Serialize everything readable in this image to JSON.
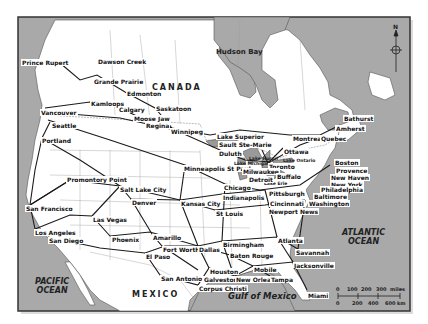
{
  "colors": {
    "ocean": "#a9a9a9",
    "land": "#ffffff",
    "frame": "#333333",
    "route": "#1a1a1a",
    "border": "#888888"
  },
  "map": {
    "regions": {
      "canada": "CANADA",
      "mexico": "MEXICO"
    },
    "water": {
      "hudson_bay": "Hudson Bay",
      "pacific": "PACIFIC\nOCEAN",
      "atlantic": "ATLANTIC\nOCEAN",
      "gulf": "Gulf of Mexico",
      "lake_superior": "Lake Superior",
      "lake_huron": "Lake Huron",
      "lake_michigan": "Lake Michigan",
      "lake_ontario": "Lake Ontario",
      "lake_erie": "Lake Erie"
    },
    "cities": [
      {
        "name": "Prince Rupert",
        "x": 21,
        "y": 59
      },
      {
        "name": "Dawson Creek",
        "x": 97,
        "y": 58
      },
      {
        "name": "Grande Prairie",
        "x": 93,
        "y": 78
      },
      {
        "name": "Edmonton",
        "x": 126,
        "y": 90
      },
      {
        "name": "Kamloops",
        "x": 90,
        "y": 100
      },
      {
        "name": "Calgary",
        "x": 118,
        "y": 106
      },
      {
        "name": "Saskatoon",
        "x": 155,
        "y": 105
      },
      {
        "name": "Moose Jaw",
        "x": 133,
        "y": 115
      },
      {
        "name": "Regina",
        "x": 145,
        "y": 122
      },
      {
        "name": "Winnipeg",
        "x": 170,
        "y": 128
      },
      {
        "name": "Vancouver",
        "x": 40,
        "y": 109
      },
      {
        "name": "Seattle",
        "x": 51,
        "y": 122
      },
      {
        "name": "Portland",
        "x": 41,
        "y": 137
      },
      {
        "name": "Lake Superior",
        "x": 216,
        "y": 133
      },
      {
        "name": "Sault Ste-Marie",
        "x": 218,
        "y": 141
      },
      {
        "name": "Duluth",
        "x": 218,
        "y": 150
      },
      {
        "name": "Montreal",
        "x": 292,
        "y": 135
      },
      {
        "name": "Quebec",
        "x": 320,
        "y": 135
      },
      {
        "name": "Ottawa",
        "x": 283,
        "y": 148
      },
      {
        "name": "Bathurst",
        "x": 343,
        "y": 115
      },
      {
        "name": "Amherst",
        "x": 335,
        "y": 125
      },
      {
        "name": "Minneapolis St Paul",
        "x": 183,
        "y": 165
      },
      {
        "name": "Toronto",
        "x": 268,
        "y": 163
      },
      {
        "name": "Milwaukee",
        "x": 242,
        "y": 168
      },
      {
        "name": "Detroit",
        "x": 248,
        "y": 176
      },
      {
        "name": "Buffalo",
        "x": 276,
        "y": 173
      },
      {
        "name": "Boston",
        "x": 334,
        "y": 159
      },
      {
        "name": "Provence",
        "x": 335,
        "y": 167
      },
      {
        "name": "New Haven",
        "x": 330,
        "y": 174
      },
      {
        "name": "New York",
        "x": 330,
        "y": 181
      },
      {
        "name": "Chicago",
        "x": 223,
        "y": 184
      },
      {
        "name": "Philadelphia",
        "x": 320,
        "y": 186
      },
      {
        "name": "Baltimore",
        "x": 313,
        "y": 193
      },
      {
        "name": "Washington",
        "x": 308,
        "y": 200
      },
      {
        "name": "Promontory Point",
        "x": 66,
        "y": 176
      },
      {
        "name": "Salt Lake City",
        "x": 119,
        "y": 186
      },
      {
        "name": "Indianapolis",
        "x": 222,
        "y": 194
      },
      {
        "name": "Pittsburgh",
        "x": 268,
        "y": 190
      },
      {
        "name": "Kansas City",
        "x": 180,
        "y": 200
      },
      {
        "name": "Cincinnati",
        "x": 269,
        "y": 200
      },
      {
        "name": "Denver",
        "x": 131,
        "y": 199
      },
      {
        "name": "Newport News",
        "x": 268,
        "y": 208
      },
      {
        "name": "St Louis",
        "x": 215,
        "y": 210
      },
      {
        "name": "San Francisco",
        "x": 25,
        "y": 205
      },
      {
        "name": "Las Vegas",
        "x": 92,
        "y": 216
      },
      {
        "name": "Los Angeles",
        "x": 34,
        "y": 229
      },
      {
        "name": "San Diego",
        "x": 48,
        "y": 237
      },
      {
        "name": "Phoenix",
        "x": 111,
        "y": 236
      },
      {
        "name": "Amarillo",
        "x": 152,
        "y": 234
      },
      {
        "name": "Birmingham",
        "x": 222,
        "y": 241
      },
      {
        "name": "Atlanta",
        "x": 277,
        "y": 237
      },
      {
        "name": "Fort Worth",
        "x": 162,
        "y": 246
      },
      {
        "name": "Dallas",
        "x": 198,
        "y": 246
      },
      {
        "name": "El Paso",
        "x": 145,
        "y": 253
      },
      {
        "name": "Savannah",
        "x": 295,
        "y": 249
      },
      {
        "name": "Baton Rouge",
        "x": 229,
        "y": 252
      },
      {
        "name": "Mobile",
        "x": 253,
        "y": 266
      },
      {
        "name": "Jacksonville",
        "x": 293,
        "y": 262
      },
      {
        "name": "Houston",
        "x": 209,
        "y": 268
      },
      {
        "name": "San Antonio",
        "x": 160,
        "y": 275
      },
      {
        "name": "Galveston",
        "x": 203,
        "y": 276
      },
      {
        "name": "New Orleans",
        "x": 235,
        "y": 276
      },
      {
        "name": "Tampa",
        "x": 270,
        "y": 276
      },
      {
        "name": "Corpus Christi",
        "x": 198,
        "y": 285
      },
      {
        "name": "Miami",
        "x": 307,
        "y": 292
      }
    ],
    "lake_labels": [
      {
        "name": "Lake Huron",
        "x": 248,
        "y": 155
      },
      {
        "name": "Lake Michigan",
        "x": 233,
        "y": 161
      },
      {
        "name": "Lake Ontario",
        "x": 282,
        "y": 157
      },
      {
        "name": "Lake Erie",
        "x": 262,
        "y": 181
      }
    ],
    "scale": {
      "miles_label": "miles",
      "miles_ticks": [
        "0",
        "100",
        "200",
        "300"
      ],
      "km_label": "km",
      "km_ticks": [
        "0",
        "200",
        "400",
        "600"
      ]
    },
    "compass": {
      "label": "N"
    }
  }
}
